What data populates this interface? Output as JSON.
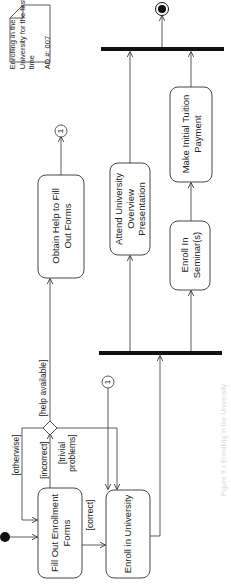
{
  "diagram": {
    "type": "UML activity diagram",
    "orientation": "rotated 90 degrees counter-clockwise",
    "note": {
      "lines": [
        "Enrolling in the",
        "University for the first",
        "time",
        "",
        "AD #: 007"
      ]
    },
    "activities": {
      "fill_out_forms": "Fill Out Enrollment Forms",
      "obtain_help": "Obtain Help to Fill Out Forms",
      "enroll_university": "Enroll in University",
      "attend_overview": "Attend University Overview Presentation",
      "enroll_seminars": "Enroll In Seminar(s)",
      "tuition_payment": "Make Initial Tuition Payment"
    },
    "activity_lines": {
      "fill_out_forms": [
        "Fill Out Enrollment",
        "Forms"
      ],
      "obtain_help": [
        "Obtain Help to Fill",
        "Out Forms"
      ],
      "enroll_university": [
        "Enroll in University"
      ],
      "attend_overview": [
        "Attend University",
        "Overview",
        "Presentation"
      ],
      "enroll_seminars": [
        "Enroll In",
        "Seminar(s)"
      ],
      "tuition_payment": [
        "Make Initial Tuition",
        "Payment"
      ]
    },
    "guards": {
      "otherwise": "[otherwise]",
      "incorrect": "[incorrect]",
      "correct": "[correct]",
      "help_available": "[help  available]",
      "trivial_problems_1": "[trivial",
      "trivial_problems_2": "problems]"
    },
    "connectors": {
      "out": "1",
      "in": "1"
    },
    "caption": "Figure 9.x  Enrolling in the University"
  }
}
